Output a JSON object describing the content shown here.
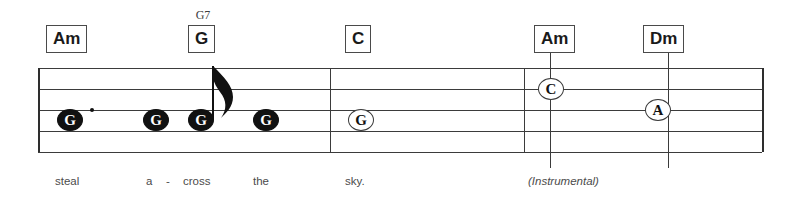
{
  "sheet": {
    "width": 798,
    "height": 204,
    "background": "#ffffff",
    "ink_color": "#3b3b3b",
    "note_fill_color": "#111111",
    "lyric_color": "#4b4b4b"
  },
  "staff": {
    "left": 38,
    "right": 762,
    "line_ys": [
      68,
      89,
      110,
      131,
      152
    ],
    "line_count": 5,
    "barline_xs": [
      330,
      524
    ],
    "end_barline_x": 762,
    "start_barline_x": 38
  },
  "chords": [
    {
      "label": "Am",
      "alt_label": "",
      "x": 46,
      "y": 25,
      "line_x": 0
    },
    {
      "label": "G",
      "alt_label": "G7",
      "x": 188,
      "y": 25,
      "line_x": 0
    },
    {
      "label": "C",
      "alt_label": "",
      "x": 345,
      "y": 25,
      "line_x": 0
    },
    {
      "label": "Am",
      "alt_label": "",
      "x": 534,
      "y": 25,
      "line_x": 550
    },
    {
      "label": "Dm",
      "alt_label": "",
      "x": 643,
      "y": 25,
      "line_x": 668
    }
  ],
  "notes": [
    {
      "pitch": "G",
      "x": 57,
      "y": 120,
      "style": "filled",
      "dotted": true,
      "stem": false,
      "flag": false
    },
    {
      "pitch": "G",
      "x": 143,
      "y": 120,
      "style": "filled",
      "dotted": false,
      "stem": false,
      "flag": false
    },
    {
      "pitch": "G",
      "x": 188,
      "y": 120,
      "style": "filled",
      "dotted": false,
      "stem": true,
      "flag": true
    },
    {
      "pitch": "G",
      "x": 253,
      "y": 120,
      "style": "filled",
      "dotted": false,
      "stem": false,
      "flag": false
    },
    {
      "pitch": "G",
      "x": 348,
      "y": 120,
      "style": "hollow",
      "dotted": false,
      "stem": false,
      "flag": false
    },
    {
      "pitch": "C",
      "x": 538,
      "y": 89,
      "style": "hollow",
      "dotted": false,
      "stem": false,
      "flag": false
    },
    {
      "pitch": "A",
      "x": 645,
      "y": 110,
      "style": "hollow",
      "dotted": false,
      "stem": false,
      "flag": false
    }
  ],
  "lyrics": [
    {
      "text": "steal",
      "x": 55,
      "y": 175,
      "italic": false
    },
    {
      "text": "a",
      "x": 146,
      "y": 175,
      "italic": false
    },
    {
      "text": "-",
      "x": 166,
      "y": 175,
      "italic": false
    },
    {
      "text": "cross",
      "x": 183,
      "y": 175,
      "italic": false
    },
    {
      "text": "the",
      "x": 253,
      "y": 175,
      "italic": false
    },
    {
      "text": "sky.",
      "x": 345,
      "y": 175,
      "italic": false
    },
    {
      "text": "(Instrumental)",
      "x": 528,
      "y": 175,
      "italic": true
    }
  ]
}
